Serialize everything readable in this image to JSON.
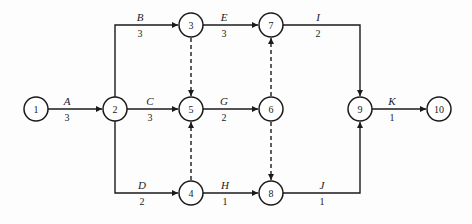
{
  "diagram": {
    "type": "activity-on-arrow network",
    "nodes": [
      {
        "id": "1",
        "label": "1",
        "x": 36,
        "y": 109
      },
      {
        "id": "2",
        "label": "2",
        "x": 115,
        "y": 109
      },
      {
        "id": "3",
        "label": "3",
        "x": 191,
        "y": 25
      },
      {
        "id": "4",
        "label": "4",
        "x": 191,
        "y": 193
      },
      {
        "id": "5",
        "label": "5",
        "x": 191,
        "y": 109
      },
      {
        "id": "6",
        "label": "6",
        "x": 271,
        "y": 109
      },
      {
        "id": "7",
        "label": "7",
        "x": 271,
        "y": 25
      },
      {
        "id": "8",
        "label": "8",
        "x": 271,
        "y": 193
      },
      {
        "id": "9",
        "label": "9",
        "x": 360,
        "y": 109
      },
      {
        "id": "10",
        "label": "10",
        "x": 439,
        "y": 109
      }
    ],
    "activities": [
      {
        "name": "A",
        "duration": "3",
        "from": "1",
        "to": "2"
      },
      {
        "name": "B",
        "duration": "3",
        "from": "2",
        "to": "3"
      },
      {
        "name": "C",
        "duration": "3",
        "from": "2",
        "to": "5"
      },
      {
        "name": "D",
        "duration": "2",
        "from": "2",
        "to": "4"
      },
      {
        "name": "E",
        "duration": "3",
        "from": "3",
        "to": "7"
      },
      {
        "name": "G",
        "duration": "2",
        "from": "5",
        "to": "6"
      },
      {
        "name": "H",
        "duration": "1",
        "from": "4",
        "to": "8"
      },
      {
        "name": "I",
        "duration": "2",
        "from": "7",
        "to": "9"
      },
      {
        "name": "J",
        "duration": "1",
        "from": "8",
        "to": "9"
      },
      {
        "name": "K",
        "duration": "1",
        "from": "9",
        "to": "10"
      }
    ],
    "dummies": [
      {
        "from": "3",
        "to": "5"
      },
      {
        "from": "4",
        "to": "5"
      },
      {
        "from": "6",
        "to": "7"
      },
      {
        "from": "6",
        "to": "8"
      }
    ]
  }
}
